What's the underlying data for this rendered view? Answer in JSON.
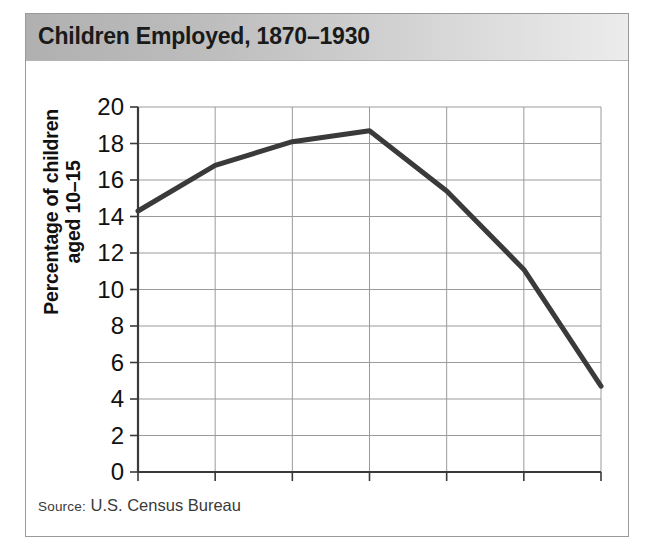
{
  "figure": {
    "title": "Children Employed, 1870–1930",
    "source_prefix": "Source:",
    "source_label": " U.S. Census Bureau"
  },
  "chart_data": {
    "type": "line",
    "title": "Children Employed, 1870–1930",
    "xlabel": "",
    "ylabel": "Percentage of children aged 10–15",
    "ylabel_line1": "Percentage of children",
    "ylabel_line2": "aged 10–15",
    "x": [
      1870,
      1880,
      1890,
      1900,
      1910,
      1920,
      1930
    ],
    "values": [
      14.3,
      16.8,
      18.1,
      18.7,
      15.4,
      11.1,
      4.7
    ],
    "categories": [
      "1870",
      "1880",
      "1890",
      "1900",
      "1910",
      "1920",
      "1930"
    ],
    "xticks": [
      "1870",
      "1880",
      "1890",
      "1900",
      "1910",
      "1920",
      "1930"
    ],
    "yticks": [
      "0",
      "2",
      "4",
      "6",
      "8",
      "10",
      "12",
      "14",
      "16",
      "18",
      "20"
    ],
    "ytick_values": [
      0,
      2,
      4,
      6,
      8,
      10,
      12,
      14,
      16,
      18,
      20
    ],
    "xlim": [
      1870,
      1930
    ],
    "ylim": [
      0,
      20
    ],
    "grid": true,
    "legend": "none",
    "series_color": "#3a3a3a",
    "grid_color": "#9b9b9b",
    "axis_color": "#3a3a3a",
    "source": "Source: U.S. Census Bureau"
  }
}
